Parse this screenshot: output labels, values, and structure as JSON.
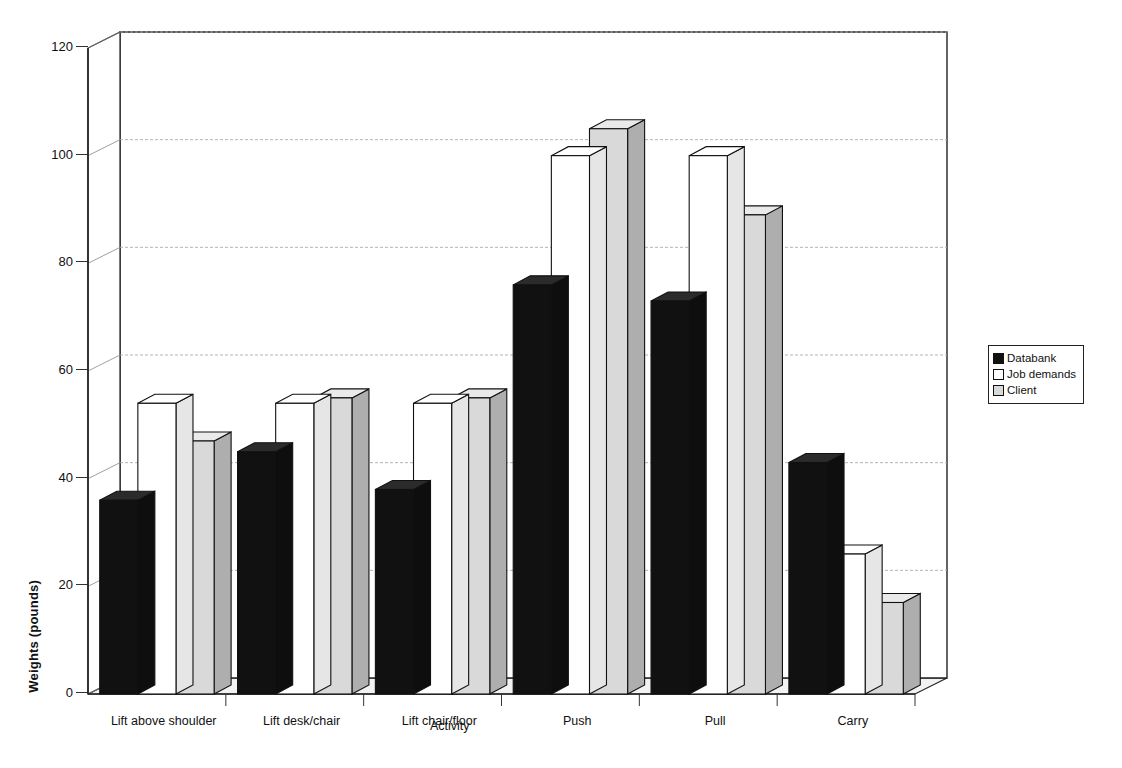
{
  "chart_data": {
    "type": "bar",
    "title": "",
    "xlabel": "Activity",
    "ylabel": "Weights (pounds)",
    "categories": [
      "Lift above shoulder",
      "Lift desk/chair",
      "Lift chair/floor",
      "Push",
      "Pull",
      "Carry"
    ],
    "series": [
      {
        "name": "Databank",
        "color": "#111111",
        "values": [
          36,
          45,
          38,
          76,
          73,
          43
        ]
      },
      {
        "name": "Job demands",
        "color": "#ffffff",
        "values": [
          54,
          54,
          54,
          100,
          100,
          26
        ]
      },
      {
        "name": "Client",
        "color": "#d9d9d9",
        "values": [
          47,
          55,
          55,
          105,
          89,
          17
        ]
      }
    ],
    "ylim": [
      0,
      120
    ],
    "yticks": [
      0,
      20,
      40,
      60,
      80,
      100,
      120
    ],
    "ytick_labels": [
      "0",
      "20",
      "40",
      "60",
      "80",
      "100",
      "120"
    ],
    "grid": true,
    "grid_axis": "y",
    "legend_position": "right",
    "style": "3d-column",
    "background": "#ffffff",
    "axis_color": "#222222",
    "grid_color": "#aaaaaa"
  },
  "legend": {
    "items": [
      {
        "label": "Databank",
        "swatch": "#111111"
      },
      {
        "label": "Job demands",
        "swatch": "#ffffff"
      },
      {
        "label": "Client",
        "swatch": "#d9d9d9"
      }
    ]
  },
  "axes": {
    "y_title": "Weights (pounds)",
    "x_title": "Activity"
  }
}
